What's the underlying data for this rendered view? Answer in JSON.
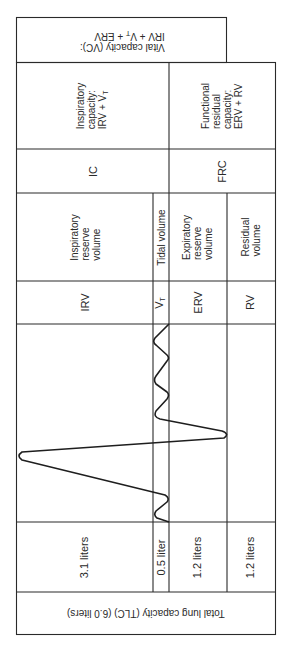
{
  "vital_capacity": {
    "line1": "Vital capacity (VC):",
    "line2": "IRV + V",
    "line2_sub": "T",
    "line2_rest": " + ERV"
  },
  "capacities": {
    "inspiratory": {
      "line1": "Inspiratory",
      "line2": "capacity:",
      "line3": "IRV + V",
      "line3_sub": "T",
      "abbr": "IC"
    },
    "functional_residual": {
      "line1": "Functional",
      "line2": "residual",
      "line3": "capacity:",
      "line4": "ERV + RV",
      "abbr": "FRC"
    }
  },
  "volumes": [
    {
      "name_lines": [
        "Inspiratory",
        "reserve",
        "volume"
      ],
      "abbr": "IRV",
      "abbr_sub": "",
      "value": "3.1 liters"
    },
    {
      "name_lines": [
        "Tidal volume"
      ],
      "abbr": "V",
      "abbr_sub": "T",
      "value": "0.5 liter"
    },
    {
      "name_lines": [
        "Expiratory",
        "reserve",
        "volume"
      ],
      "abbr": "ERV",
      "abbr_sub": "",
      "value": "1.2 liters"
    },
    {
      "name_lines": [
        "Residual",
        "volume"
      ],
      "abbr": "RV",
      "abbr_sub": "",
      "value": "1.2 liters"
    }
  ],
  "total": {
    "label": "Total lung capacity (TLC) (6.0 liters)"
  },
  "colors": {
    "line": "#2a2a2a",
    "background": "#ffffff"
  }
}
